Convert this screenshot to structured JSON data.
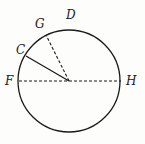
{
  "diagram": {
    "type": "circle-with-radii",
    "colors": {
      "stroke": "#1a1a1a",
      "background": "#fdfdfb"
    },
    "circle": {
      "cx": 69,
      "cy": 81,
      "r": 51
    },
    "lines": [
      {
        "id": "diameter-FH",
        "from": "F",
        "to": "H",
        "style": "dashed"
      },
      {
        "id": "radius-C",
        "from": "center",
        "to": "C",
        "style": "solid"
      },
      {
        "id": "radius-G",
        "from": "center",
        "to": "G",
        "style": "dashed"
      }
    ],
    "labels": {
      "D": "D",
      "G": "G",
      "C": "C",
      "F": "F",
      "H": "H"
    }
  }
}
